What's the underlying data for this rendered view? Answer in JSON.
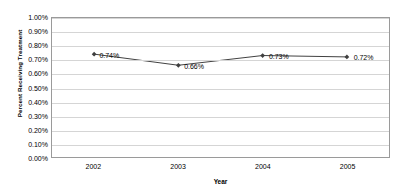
{
  "chart_data": {
    "type": "line",
    "title": "",
    "xlabel": "Year",
    "ylabel": "Percent Receiving Treatment",
    "categories": [
      "2002",
      "2003",
      "2004",
      "2005"
    ],
    "values": [
      0.74,
      0.66,
      0.73,
      0.72
    ],
    "point_labels": [
      "0.74%",
      "0.66%",
      "0.73%",
      "0.72%"
    ],
    "ylim": [
      0,
      1.0
    ],
    "ytick_values": [
      0,
      0.1,
      0.2,
      0.3,
      0.4,
      0.5,
      0.6,
      0.7,
      0.8,
      0.9,
      1.0
    ],
    "ytick_labels": [
      "0.00%",
      "0.10%",
      "0.20%",
      "0.30%",
      "0.40%",
      "0.50%",
      "0.60%",
      "0.70%",
      "0.80%",
      "0.90%",
      "1.00%"
    ],
    "grid": true,
    "grid_axis": "y",
    "legend": false,
    "legend_position": "none",
    "series_color": "#3f3f3f",
    "grid_color": "#d5d5d5",
    "frame_color": "#9a9a9a",
    "background_color": "#ffffff",
    "marker": "diamond"
  }
}
